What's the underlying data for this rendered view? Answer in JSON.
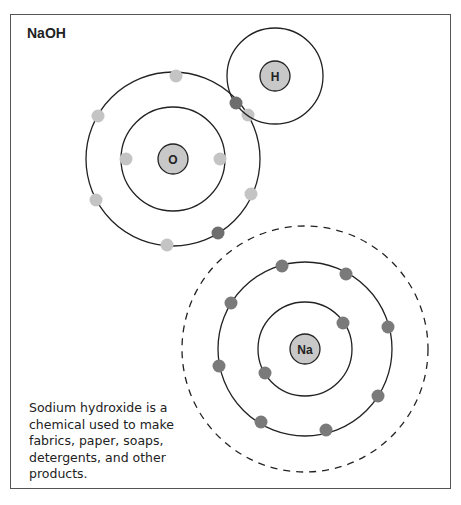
{
  "title": "NaOH",
  "caption": "Sodium hydroxide is a chemical used to make fabrics, paper, soaps, detergents, and other products.",
  "colors": {
    "nucleus_fill": "#c8c8c8",
    "own_electron": "#c4c4c4",
    "shared_electron": "#6e6e6e",
    "sodium_electron": "#7a7a7a",
    "orbit_stroke": "#222222"
  },
  "atoms": [
    {
      "id": "O",
      "label": "O",
      "cx": 173,
      "cy": 159,
      "nucleus_r": 15,
      "shells": [
        52,
        87
      ]
    },
    {
      "id": "H",
      "label": "H",
      "cx": 275,
      "cy": 76,
      "nucleus_r": 15,
      "shells": [
        48
      ]
    },
    {
      "id": "Na",
      "label": "Na",
      "cx": 305,
      "cy": 349,
      "nucleus_r": 15,
      "shells": [
        47,
        87,
        123
      ],
      "outer_shell_dashed": true
    }
  ]
}
